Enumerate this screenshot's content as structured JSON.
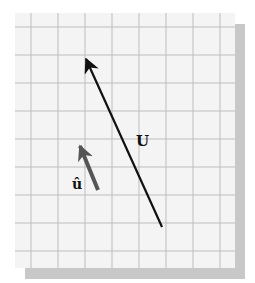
{
  "figure": {
    "type": "vector-diagram",
    "background": "grid",
    "grid": {
      "columns": 8,
      "rows": 9,
      "line_color": "#bdbdbd",
      "paper_color": "#f4f4f4",
      "shadow_color": "#c8c8c8"
    },
    "vectors": [
      {
        "id": "U",
        "label": "U",
        "color": "#111111",
        "from": [
          162,
          227
        ],
        "to": [
          85,
          56
        ]
      },
      {
        "id": "u_hat",
        "label": "û",
        "color": "#555555",
        "from": [
          98,
          190
        ],
        "to": [
          79,
          143
        ]
      }
    ],
    "labels": {
      "U": "U",
      "u_hat": "û"
    }
  }
}
